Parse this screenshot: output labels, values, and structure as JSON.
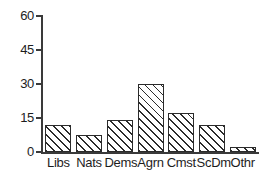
{
  "chart_data": {
    "type": "bar",
    "title": "",
    "subtitle": "",
    "xlabel": "",
    "ylabel": "",
    "categories": [
      "Libs",
      "Nats",
      "Dems",
      "Agrn",
      "Cmst",
      "ScDm",
      "Othr"
    ],
    "values": [
      12,
      7.5,
      14,
      30,
      17,
      12,
      2
    ],
    "ylim": [
      0,
      60
    ],
    "yticks": [
      0,
      15,
      30,
      45,
      60
    ],
    "ytick_labels": [
      "0",
      "15",
      "30",
      "45",
      "60"
    ],
    "grid": false,
    "legend": null,
    "series": [
      {
        "name": "",
        "values": [
          12,
          7.5,
          14,
          30,
          17,
          12,
          2
        ]
      }
    ],
    "bar_style": {
      "fill": "#ffffff",
      "hatch": "diagonal-45",
      "hatch_color": "#2b2b2b",
      "edge_color": "#2b2b2b"
    },
    "axis_color": "#3a3a3a",
    "text_color": "#1d1d1d",
    "background": "#ffffff"
  }
}
